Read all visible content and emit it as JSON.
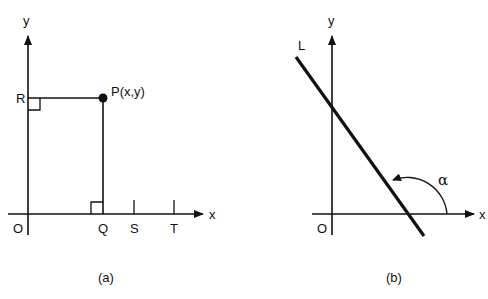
{
  "figure": {
    "panels": [
      {
        "id": "a",
        "caption": "(a)",
        "axes": {
          "x_label": "x",
          "y_label": "y",
          "origin_label": "O"
        },
        "point": {
          "label": "P(x,y)"
        },
        "x_axis_points": [
          "Q",
          "S",
          "T"
        ],
        "y_axis_points": [
          "R"
        ],
        "right_angle_markers": [
          "at R",
          "at Q"
        ]
      },
      {
        "id": "b",
        "caption": "(b)",
        "axes": {
          "x_label": "x",
          "y_label": "y",
          "origin_label": "O"
        },
        "line": {
          "label": "L"
        },
        "angle": {
          "label": "α"
        }
      }
    ]
  },
  "colors": {
    "ink": "#111111",
    "background": "#ffffff"
  }
}
